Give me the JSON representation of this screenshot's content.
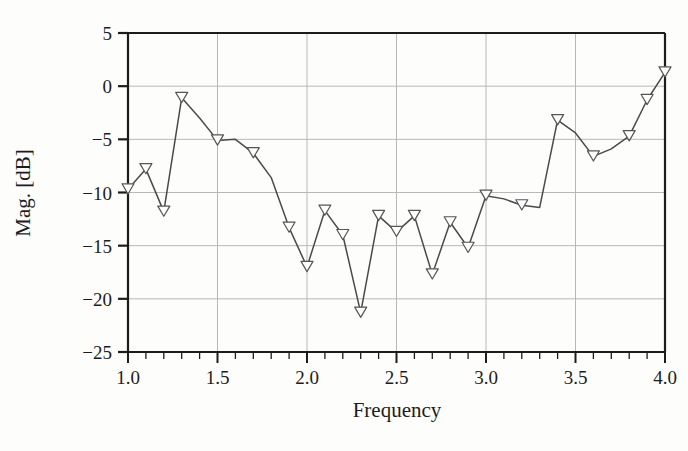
{
  "chart_data": {
    "type": "line",
    "title": "",
    "xlabel": "Frequency",
    "ylabel": "Mag. [dB]",
    "xlim": [
      1.0,
      4.0
    ],
    "ylim": [
      -25,
      5
    ],
    "grid": true,
    "legend": null,
    "marker": "triangle-down-open",
    "line_color": "#4a4a4a",
    "marker_edge_color": "#555555",
    "marker_face_color": "#ffffff",
    "grid_color": "#b8b8b8",
    "axis_color": "#1c1c1c",
    "background_color": "#fdfdfb",
    "x_major_ticks": [
      1.0,
      1.5,
      2.0,
      2.5,
      3.0,
      3.5,
      4.0
    ],
    "x_major_tick_labels": [
      "1.0",
      "1.5",
      "2.0",
      "2.5",
      "3.0",
      "3.5",
      "4.0"
    ],
    "x_minor_tick_step": 0.1,
    "y_major_ticks": [
      5,
      0,
      -5,
      -10,
      -15,
      -20,
      -25
    ],
    "y_major_tick_labels": [
      "5",
      "0",
      "−5",
      "−10",
      "−15",
      "−20",
      "−25"
    ],
    "x": [
      1.0,
      1.1,
      1.2,
      1.3,
      1.4,
      1.5,
      1.6,
      1.7,
      1.8,
      1.9,
      2.0,
      2.1,
      2.2,
      2.3,
      2.4,
      2.5,
      2.6,
      2.7,
      2.8,
      2.9,
      3.0,
      3.1,
      3.2,
      3.3,
      3.4,
      3.5,
      3.6,
      3.7,
      3.8,
      3.9,
      4.0
    ],
    "values": [
      -9.7,
      -7.8,
      -11.8,
      -1.1,
      -3.0,
      -5.1,
      -5.0,
      -6.3,
      -8.6,
      -13.3,
      -17.0,
      -11.7,
      -14.0,
      -21.3,
      -12.2,
      -13.7,
      -12.2,
      -17.7,
      -12.8,
      -15.2,
      -10.3,
      -10.6,
      -11.2,
      -11.4,
      -3.2,
      -4.4,
      -6.6,
      -5.9,
      -4.7,
      -1.3,
      1.3
    ],
    "series": [
      {
        "name": "Magnitude",
        "values": [
          -9.7,
          -7.8,
          -11.8,
          -1.1,
          -3.0,
          -5.1,
          -5.0,
          -6.3,
          -8.6,
          -13.3,
          -17.0,
          -11.7,
          -14.0,
          -21.3,
          -12.2,
          -13.7,
          -12.2,
          -17.7,
          -12.8,
          -15.2,
          -10.3,
          -10.6,
          -11.2,
          -11.4,
          -3.2,
          -4.4,
          -6.6,
          -5.9,
          -4.7,
          -1.3,
          1.3
        ]
      }
    ],
    "markers_at": [
      1.0,
      1.1,
      1.2,
      1.3,
      1.5,
      1.7,
      1.9,
      2.0,
      2.1,
      2.2,
      2.3,
      2.4,
      2.5,
      2.6,
      2.7,
      2.8,
      2.9,
      3.0,
      3.2,
      3.4,
      3.6,
      3.8,
      3.9,
      4.0
    ]
  }
}
